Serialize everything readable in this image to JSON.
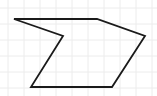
{
  "diagram": {
    "type": "polygon",
    "width": 157,
    "height": 96,
    "background": "#ffffff",
    "grid": {
      "visible": true,
      "spacing": 16,
      "color": "#ececec"
    },
    "shape": {
      "name": "concave-hexagon",
      "stroke": "#1a1a1a",
      "stroke_width": 1.8,
      "fill": "none",
      "vertices": [
        {
          "x": 14,
          "y": 19
        },
        {
          "x": 97,
          "y": 19
        },
        {
          "x": 145,
          "y": 36
        },
        {
          "x": 112,
          "y": 87
        },
        {
          "x": 31,
          "y": 87
        },
        {
          "x": 63,
          "y": 36
        }
      ]
    }
  }
}
